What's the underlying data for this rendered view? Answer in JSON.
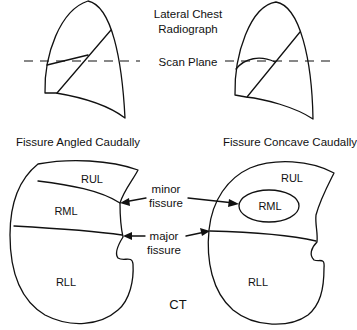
{
  "title_lines": [
    "Lateral Chest",
    "Radiograph"
  ],
  "scan_plane_label": "Scan Plane",
  "left_panel": {
    "caption": "Fissure Angled Caudally",
    "lobes": [
      "RUL",
      "RML",
      "RLL"
    ]
  },
  "right_panel": {
    "caption": "Fissure Concave Caudally",
    "lobes": [
      "RUL",
      "RML",
      "RLL"
    ]
  },
  "annotations": {
    "minor_fissure": [
      "minor",
      "fissure"
    ],
    "major_fissure": [
      "major",
      "fissure"
    ]
  },
  "bottom_label": "CT",
  "colors": {
    "stroke": "#111111",
    "background": "#ffffff"
  }
}
